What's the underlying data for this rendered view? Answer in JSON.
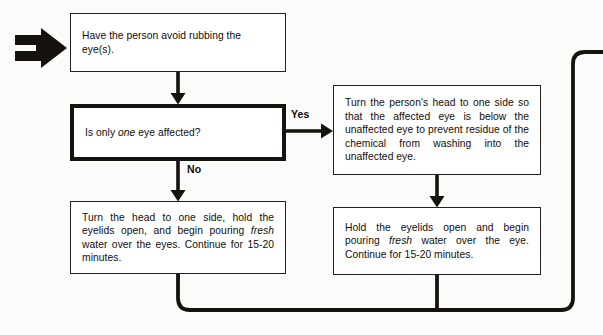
{
  "diagram": {
    "stroke_color": "#15120f",
    "box_border_color": "#24211f",
    "background": "#fbfbfa"
  },
  "entry": {
    "icon": "block-arrow-right",
    "label": ""
  },
  "nodes": {
    "advice": {
      "id": "have-person-avoid-rubbing",
      "shape": "process",
      "text": "Have the person avoid rubbing the eye(s)."
    },
    "decision": {
      "id": "is-only-one-eye-affected",
      "shape": "decision",
      "text_before": "Is only ",
      "text_emphasis": "one",
      "text_after": " eye affected?",
      "text": "Is only one eye affected?"
    },
    "both_eyes": {
      "id": "turn-head-both-eyes",
      "shape": "process",
      "text_before": "Turn the head to one side, hold the eyelids open, and begin pouring ",
      "text_emphasis": "fresh",
      "text_after": " water over the eyes. Continue for 15-20 minutes.",
      "text": "Turn the head to one side, hold the eyelids open, and begin pouring fresh water over the eyes. Continue for 15-20 minutes."
    },
    "turn_head": {
      "id": "turn-head-affected-eye-below",
      "shape": "process",
      "text": "Turn the person's head to one side so that the affected eye is below the unaffected eye to prevent residue of the chemical from washing into the unaffected eye."
    },
    "hold_lids": {
      "id": "hold-eyelids-open-one-eye",
      "shape": "process",
      "text_before": "Hold the eyelids open and begin pouring ",
      "text_emphasis": "fresh",
      "text_after": " water over the eye. Continue for 15-20 minutes.",
      "text": "Hold the eyelids open and begin pouring fresh water over the eye. Continue for 15-20 minutes."
    }
  },
  "edges": {
    "yes_label": "Yes",
    "no_label": "No"
  }
}
